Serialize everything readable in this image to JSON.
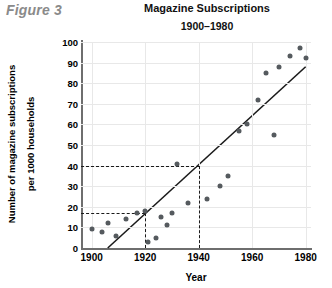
{
  "figure": {
    "label": "Figure 3"
  },
  "chart_data": {
    "type": "scatter",
    "title": "Magazine Subscriptions",
    "subtitle": "1900–1980",
    "xlabel": "Year",
    "ylabel_line1": "Number of magazine subscriptions",
    "ylabel_line2": "per 1000 households",
    "xlim": [
      1896,
      1982
    ],
    "ylim": [
      0,
      100
    ],
    "xticks": [
      1900,
      1920,
      1940,
      1960,
      1980
    ],
    "yticks": [
      0,
      10,
      20,
      30,
      40,
      50,
      60,
      70,
      80,
      90,
      100
    ],
    "grid": true,
    "legend": "none",
    "points": [
      {
        "x": 1900,
        "y": 9
      },
      {
        "x": 1904,
        "y": 8
      },
      {
        "x": 1906,
        "y": 12
      },
      {
        "x": 1909,
        "y": 6
      },
      {
        "x": 1913,
        "y": 14
      },
      {
        "x": 1917,
        "y": 17
      },
      {
        "x": 1920,
        "y": 18
      },
      {
        "x": 1921,
        "y": 3
      },
      {
        "x": 1924,
        "y": 5
      },
      {
        "x": 1926,
        "y": 15
      },
      {
        "x": 1928,
        "y": 11
      },
      {
        "x": 1930,
        "y": 17
      },
      {
        "x": 1932,
        "y": 41
      },
      {
        "x": 1936,
        "y": 22
      },
      {
        "x": 1943,
        "y": 24
      },
      {
        "x": 1948,
        "y": 30
      },
      {
        "x": 1951,
        "y": 35
      },
      {
        "x": 1955,
        "y": 57
      },
      {
        "x": 1958,
        "y": 60
      },
      {
        "x": 1962,
        "y": 72
      },
      {
        "x": 1965,
        "y": 85
      },
      {
        "x": 1968,
        "y": 55
      },
      {
        "x": 1970,
        "y": 88
      },
      {
        "x": 1974,
        "y": 93
      },
      {
        "x": 1978,
        "y": 97
      },
      {
        "x": 1980,
        "y": 92
      }
    ],
    "trendline": {
      "x1": 1906,
      "y1": 0,
      "x2": 1980,
      "y2": 88
    },
    "reference_lines": [
      {
        "value_y": 40,
        "value_x": 1940
      },
      {
        "value_y": 17,
        "value_x": 1920
      }
    ],
    "colors": {
      "point": "#555a5e",
      "trendline": "#1a1a1a",
      "axis": "#6e6e6e",
      "grid": "#e8e8e8",
      "figure_label": "#8a8a8a"
    }
  }
}
